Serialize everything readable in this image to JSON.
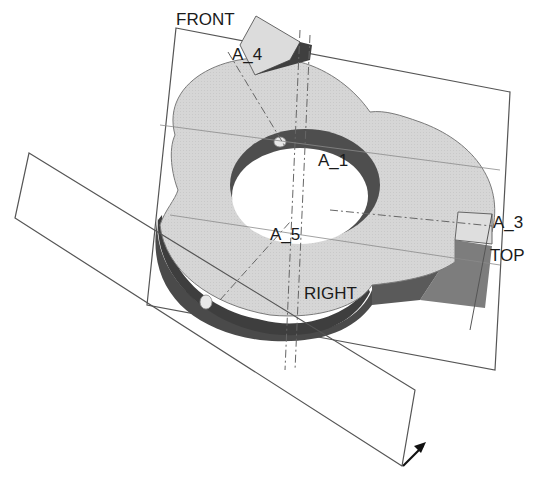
{
  "viewport": {
    "background": "#ffffff",
    "datum_planes": [
      {
        "name": "FRONT",
        "label": "FRONT"
      },
      {
        "name": "TOP",
        "label": "TOP"
      },
      {
        "name": "RIGHT",
        "label": "RIGHT"
      }
    ],
    "axes": [
      {
        "name": "A_1",
        "label": "A_1"
      },
      {
        "name": "A_3",
        "label": "A_3"
      },
      {
        "name": "A_4",
        "label": "A_4"
      },
      {
        "name": "A_5",
        "label": "A_5"
      }
    ],
    "colors": {
      "part_top_face": "#d4d4d4",
      "part_side_dark": "#4a4a4a",
      "part_side_mid": "#7a7a7a",
      "hole_interior": "#ffffff",
      "datum_plane_edge": "#555555",
      "axis_line": "#666666"
    },
    "csys_arrow_icon": "coordinate-system-arrow"
  }
}
